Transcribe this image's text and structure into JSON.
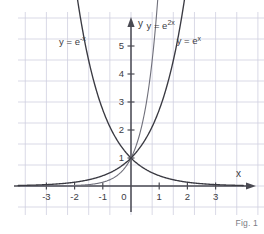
{
  "figure": {
    "caption": "Fig. 1",
    "background_color": "#ffffff",
    "grid_color": "#cfcfe0",
    "axis_color": "#4a4a52",
    "label_color": "#3c3c44",
    "caption_color": "#7b7b84"
  },
  "chart_data": {
    "type": "line",
    "title": "",
    "xlabel": "x",
    "ylabel": "y",
    "xlim": [
      -3.9,
      3.9
    ],
    "ylim": [
      -0.35,
      5.9
    ],
    "xticks": [
      -3,
      -2,
      -1,
      0,
      1,
      2,
      3
    ],
    "xtick_labels": [
      "-3",
      "-2",
      "-1",
      "0",
      "1",
      "2",
      "3"
    ],
    "yticks": [
      1,
      2,
      3,
      4,
      5
    ],
    "ytick_labels": [
      "1",
      "2",
      "3",
      "4",
      "5"
    ],
    "grid": true,
    "grid_spacing_x": 0.75,
    "grid_spacing_y": 0.75,
    "legend": "inline-annotations",
    "series": [
      {
        "name": "y = e^-x",
        "label_text": "y = e",
        "label_exponent": "-x",
        "color": "#3a3a42",
        "label_x": -2.55,
        "label_y": 5.05,
        "formula": "exp(-x)",
        "points": [
          {
            "x": -3,
            "y": 20.09
          },
          {
            "x": -2.5,
            "y": 12.18
          },
          {
            "x": -2,
            "y": 7.39
          },
          {
            "x": -1.5,
            "y": 4.48
          },
          {
            "x": -1,
            "y": 2.72
          },
          {
            "x": -0.5,
            "y": 1.65
          },
          {
            "x": 0,
            "y": 1
          },
          {
            "x": 0.5,
            "y": 0.61
          },
          {
            "x": 1,
            "y": 0.37
          },
          {
            "x": 1.5,
            "y": 0.22
          },
          {
            "x": 2,
            "y": 0.14
          },
          {
            "x": 2.5,
            "y": 0.08
          },
          {
            "x": 3,
            "y": 0.05
          },
          {
            "x": 3.5,
            "y": 0.03
          }
        ]
      },
      {
        "name": "y = e^2x",
        "label_text": "y = e",
        "label_exponent": "2x",
        "color": "#6f6f7a",
        "label_x": 0.55,
        "label_y": 5.62,
        "formula": "exp(2x)",
        "points": [
          {
            "x": -3.5,
            "y": 0.001
          },
          {
            "x": -3,
            "y": 0.002
          },
          {
            "x": -2.5,
            "y": 0.007
          },
          {
            "x": -2,
            "y": 0.018
          },
          {
            "x": -1.5,
            "y": 0.05
          },
          {
            "x": -1,
            "y": 0.135
          },
          {
            "x": -0.5,
            "y": 0.368
          },
          {
            "x": 0,
            "y": 1
          },
          {
            "x": 0.25,
            "y": 1.65
          },
          {
            "x": 0.5,
            "y": 2.72
          },
          {
            "x": 0.75,
            "y": 4.48
          },
          {
            "x": 0.9,
            "y": 6.05
          }
        ]
      },
      {
        "name": "y = e^x",
        "label_text": "y = e",
        "label_exponent": "x",
        "color": "#3a3a42",
        "label_x": 1.62,
        "label_y": 5.08,
        "formula": "exp(x)",
        "points": [
          {
            "x": -3.5,
            "y": 0.03
          },
          {
            "x": -3,
            "y": 0.05
          },
          {
            "x": -2.5,
            "y": 0.08
          },
          {
            "x": -2,
            "y": 0.14
          },
          {
            "x": -1.5,
            "y": 0.22
          },
          {
            "x": -1,
            "y": 0.37
          },
          {
            "x": -0.5,
            "y": 0.61
          },
          {
            "x": 0,
            "y": 1
          },
          {
            "x": 0.5,
            "y": 1.65
          },
          {
            "x": 1,
            "y": 2.72
          },
          {
            "x": 1.5,
            "y": 4.48
          },
          {
            "x": 1.8,
            "y": 6.05
          }
        ]
      }
    ],
    "annotations": [
      {
        "text": "y = e^-x",
        "x": -2.55,
        "y": 5.05
      },
      {
        "text": "y = e^2x",
        "x": 0.55,
        "y": 5.62
      },
      {
        "text": "y = e^x",
        "x": 1.62,
        "y": 5.08
      }
    ]
  }
}
